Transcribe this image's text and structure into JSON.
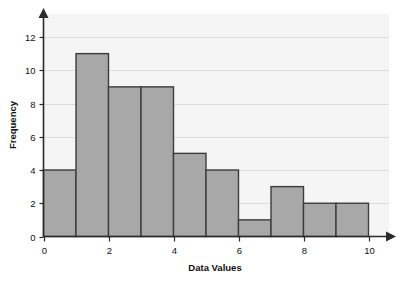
{
  "chart_data": {
    "type": "bar",
    "title": "",
    "xlabel": "Data Values",
    "ylabel": "Frequency",
    "categories": [
      "0-1",
      "1-2",
      "2-3",
      "3-4",
      "4-5",
      "5-6",
      "6-7",
      "7-8",
      "8-9",
      "9-10"
    ],
    "bin_edges": [
      0,
      1,
      2,
      3,
      4,
      5,
      6,
      7,
      8,
      9,
      10
    ],
    "values": [
      4,
      11,
      9,
      9,
      5,
      4,
      1,
      3,
      2,
      2
    ],
    "bin_width": 1,
    "xlim": [
      0,
      10
    ],
    "ylim": [
      0,
      13
    ],
    "xticks": [
      0,
      2,
      4,
      6,
      8,
      10
    ],
    "xtick_labels": [
      "0",
      "2",
      "4",
      "6",
      "8",
      "10"
    ],
    "yticks": [
      0,
      2,
      4,
      6,
      8,
      10,
      12
    ],
    "ytick_labels": [
      "0",
      "2",
      "4",
      "6",
      "8",
      "10",
      "12"
    ],
    "grid": "horizontal",
    "legend": "none",
    "colors": {
      "bar_fill": "#a8a8a8",
      "bar_stroke": "#3c3c3c",
      "plot_background": "#f5f5f5",
      "gridline": "#dcdcdc",
      "axis": "#2b2b2b",
      "text": "#101010"
    }
  }
}
